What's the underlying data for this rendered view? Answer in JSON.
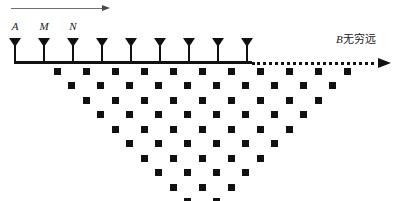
{
  "figure": {
    "width": 398,
    "height": 201,
    "background": "#ffffff",
    "ink_color": "#111111",
    "arrow_gray": "#6e6e6e"
  },
  "top_arrow": {
    "name": "direction-of-survey-arrow",
    "x_start": 11,
    "x_end": 110,
    "y": 8,
    "head_length": 8
  },
  "survey_line": {
    "y": 61,
    "x_start": 14,
    "x_solid_end": 252,
    "x_dotted_end": 374,
    "x_arrow_tip": 391,
    "thickness": 3
  },
  "electrodes": {
    "count": 9,
    "spacing": 29,
    "x_first": 15,
    "stem_top_y": 38,
    "positions": [
      15,
      44,
      73,
      102,
      131,
      160,
      189,
      218,
      247
    ],
    "labels": [
      {
        "text": "A",
        "x": 15,
        "y": 20
      },
      {
        "text": "M",
        "x": 44,
        "y": 20
      },
      {
        "text": "N",
        "x": 73,
        "y": 20
      }
    ]
  },
  "infinity_label": {
    "symbol": "B",
    "text": "无穷远",
    "x": 336,
    "y": 30
  },
  "chart_data": {
    "type": "scatter",
    "title": "",
    "xlabel": "",
    "ylabel": "",
    "marker": "filled-square",
    "marker_size": 7,
    "x_origin": 57,
    "y_origin": 71,
    "x_step": 29,
    "y_step": 14.5,
    "x_row_offset": 14.5,
    "rows": [
      {
        "n": 1,
        "count": 11,
        "x_start": 57.0,
        "y": 71.0
      },
      {
        "n": 2,
        "count": 10,
        "x_start": 71.5,
        "y": 85.5
      },
      {
        "n": 3,
        "count": 9,
        "x_start": 86.0,
        "y": 100.0
      },
      {
        "n": 4,
        "count": 8,
        "x_start": 100.5,
        "y": 114.5
      },
      {
        "n": 5,
        "count": 7,
        "x_start": 115.0,
        "y": 129.0
      },
      {
        "n": 6,
        "count": 6,
        "x_start": 129.5,
        "y": 143.5
      },
      {
        "n": 7,
        "count": 5,
        "x_start": 144.0,
        "y": 158.0
      },
      {
        "n": 8,
        "count": 4,
        "x_start": 158.5,
        "y": 172.5
      },
      {
        "n": 9,
        "count": 3,
        "x_start": 173.0,
        "y": 187.0
      }
    ],
    "extra_rows": [
      {
        "n": 10,
        "count": 2,
        "x_start": 187.5,
        "y": 201.5
      },
      {
        "n": 11,
        "count": 1,
        "x_start": 202.0,
        "y": 216.0
      }
    ],
    "total_points": 63
  }
}
